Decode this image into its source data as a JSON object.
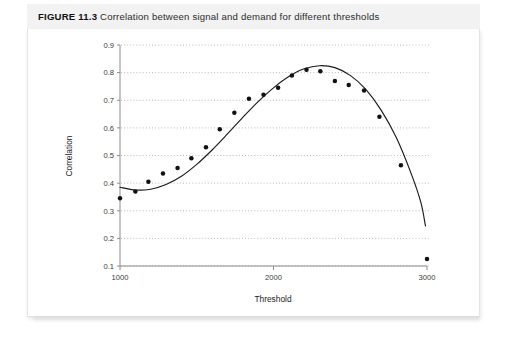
{
  "caption": {
    "figure_label": "FIGURE 11.3",
    "text": "Correlation between signal and demand for different thresholds",
    "full": "FIGURE 11.3 Correlation between signal and demand for different thresholds"
  },
  "colors": {
    "caption_background": "#f2f2f2",
    "panel_background": "#ffffff",
    "panel_border": "#e3e3e3",
    "axis": "#8c8c8c",
    "gridline": "#a8a8a8",
    "curve": "#1a1a1a",
    "marker": "#111111",
    "text": "#2b2b2b"
  },
  "chart_data": {
    "type": "scatter",
    "title": "",
    "xlabel": "Threshold",
    "ylabel": "Correlation",
    "xlim": [
      950,
      3050
    ],
    "ylim": [
      0.1,
      0.9
    ],
    "xticks": [
      1000,
      2000,
      3000
    ],
    "xtick_labels": [
      "1000",
      "2000",
      "3000"
    ],
    "yticks": [
      0.1,
      0.2,
      0.3,
      0.4,
      0.5,
      0.6,
      0.7,
      0.8,
      0.9
    ],
    "ytick_labels": [
      "0.1",
      "0.2",
      "0.3",
      "0.4",
      "0.5",
      "0.6",
      "0.7",
      "0.8",
      "0.9"
    ],
    "grid": "horizontal-dotted",
    "legend": "none",
    "series": [
      {
        "name": "Observed correlation",
        "type": "scatter",
        "marker": "filled-circle",
        "points": [
          [
            1000,
            0.345
          ],
          [
            1100,
            0.37
          ],
          [
            1185,
            0.405
          ],
          [
            1280,
            0.435
          ],
          [
            1375,
            0.455
          ],
          [
            1465,
            0.49
          ],
          [
            1560,
            0.53
          ],
          [
            1650,
            0.595
          ],
          [
            1745,
            0.655
          ],
          [
            1840,
            0.705
          ],
          [
            1935,
            0.72
          ],
          [
            2030,
            0.745
          ],
          [
            2120,
            0.79
          ],
          [
            2215,
            0.81
          ],
          [
            2305,
            0.805
          ],
          [
            2400,
            0.77
          ],
          [
            2490,
            0.755
          ],
          [
            2590,
            0.735
          ],
          [
            2690,
            0.64
          ],
          [
            2830,
            0.465
          ],
          [
            3000,
            0.125
          ]
        ]
      },
      {
        "name": "Fitted curve",
        "type": "line",
        "points": [
          [
            1000,
            0.385
          ],
          [
            1100,
            0.375
          ],
          [
            1200,
            0.378
          ],
          [
            1300,
            0.395
          ],
          [
            1400,
            0.425
          ],
          [
            1500,
            0.468
          ],
          [
            1600,
            0.52
          ],
          [
            1700,
            0.578
          ],
          [
            1800,
            0.638
          ],
          [
            1900,
            0.695
          ],
          [
            2000,
            0.745
          ],
          [
            2100,
            0.786
          ],
          [
            2200,
            0.814
          ],
          [
            2300,
            0.825
          ],
          [
            2400,
            0.818
          ],
          [
            2500,
            0.79
          ],
          [
            2600,
            0.74
          ],
          [
            2700,
            0.665
          ],
          [
            2800,
            0.565
          ],
          [
            2900,
            0.43
          ],
          [
            2960,
            0.33
          ],
          [
            2990,
            0.245
          ]
        ]
      }
    ],
    "annotations": []
  }
}
